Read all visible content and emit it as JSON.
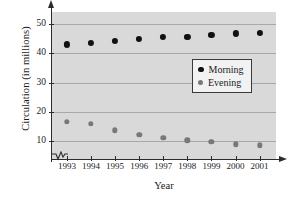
{
  "chart_data": {
    "type": "scatter",
    "title": "",
    "xlabel": "Year",
    "ylabel": "Circulation (in millions)",
    "categories": [
      "1993",
      "1994",
      "1995",
      "1996",
      "1997",
      "1998",
      "1999",
      "2000",
      "2001"
    ],
    "yticks": [
      10,
      20,
      30,
      40,
      50
    ],
    "ylim": [
      4,
      54
    ],
    "grid": true,
    "axis_break": true,
    "legend_position": "center-right",
    "series": [
      {
        "name": "Morning",
        "color": "#111111",
        "values": [
          43.0,
          43.4,
          44.2,
          44.8,
          45.4,
          45.6,
          46.1,
          46.7,
          46.8
        ]
      },
      {
        "name": "Evening",
        "color": "#787878",
        "values": [
          16.6,
          15.9,
          13.8,
          12.2,
          11.2,
          10.3,
          9.8,
          9.0,
          8.7
        ]
      }
    ]
  },
  "legend": {
    "entries": [
      {
        "label": "Morning"
      },
      {
        "label": "Evening"
      }
    ]
  }
}
